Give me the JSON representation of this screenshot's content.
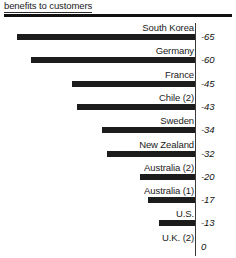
{
  "header": {
    "title": "benefits to customers"
  },
  "chart_data": {
    "type": "bar",
    "orientation": "horizontal",
    "title": "benefits to customers",
    "xlabel": "",
    "ylabel": "",
    "grid": false,
    "legend": false,
    "baseline": 0,
    "xlim": [
      -65,
      0
    ],
    "categories": [
      "South Korea",
      "Germany",
      "France",
      "Chile (2)",
      "Sweden",
      "New Zealand",
      "Australia (2)",
      "Australia (1)",
      "U.S.",
      "U.K. (2)"
    ],
    "values": [
      -65,
      -60,
      -45,
      -43,
      -34,
      -32,
      -20,
      -17,
      -13,
      0
    ],
    "value_labels": [
      "-65",
      "-60",
      "-45",
      "-43",
      "-34",
      "-32",
      "-20",
      "-17",
      "-13",
      "0"
    ],
    "rows": [
      {
        "label": "South Korea",
        "value": -65,
        "value_label": "-65"
      },
      {
        "label": "Germany",
        "value": -60,
        "value_label": "-60"
      },
      {
        "label": "France",
        "value": -45,
        "value_label": "-45"
      },
      {
        "label": "Chile (2)",
        "value": -43,
        "value_label": "-43"
      },
      {
        "label": "Sweden",
        "value": -34,
        "value_label": "-34"
      },
      {
        "label": "New Zealand",
        "value": -32,
        "value_label": "-32"
      },
      {
        "label": "Australia (2)",
        "value": -20,
        "value_label": "-20"
      },
      {
        "label": "Australia (1)",
        "value": -17,
        "value_label": "-17"
      },
      {
        "label": "U.S.",
        "value": -13,
        "value_label": "-13"
      },
      {
        "label": "U.K. (2)",
        "value": 0,
        "value_label": "0"
      }
    ],
    "colors": {
      "bar": "#1c1c1c",
      "text": "#1a1a1a",
      "axis": "#3a3a3a",
      "rule": "#111111"
    }
  }
}
